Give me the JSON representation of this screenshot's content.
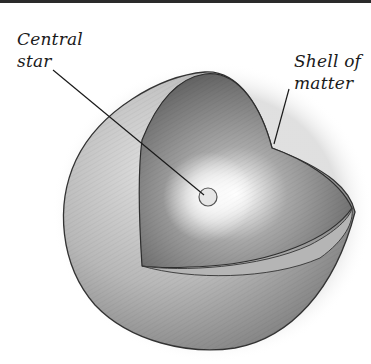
{
  "figure": {
    "type": "cutaway-sphere",
    "labels": {
      "central_star": {
        "line1": "Central",
        "line2": "star"
      },
      "shell": {
        "line1": "Shell of",
        "line2": "matter"
      }
    },
    "colors": {
      "background": "#ffffff",
      "top_border": "#2a2a2a",
      "outer_shell_light": "#cfcfcf",
      "outer_shell_dark": "#8a8a8a",
      "inner_surface_dark": "#5e5e5e",
      "inner_surface_mid": "#9a9a9a",
      "star_glow": "#ffffff",
      "outline": "#333333"
    }
  }
}
